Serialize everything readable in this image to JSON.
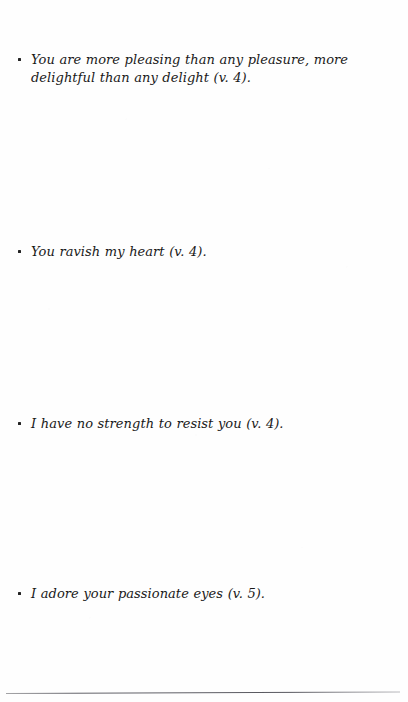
{
  "page": {
    "background_color": "#fefefe",
    "text_color": "#191919",
    "rule_color": "#4a4a50"
  },
  "content": {
    "bullet_marker": "•",
    "items": [
      {
        "text": "You are more pleasing than any pleasure, more delightful than any delight (v. 4)."
      },
      {
        "text": "You ravish my heart (v. 4)."
      },
      {
        "text": "I have no strength to resist you (v. 4)."
      },
      {
        "text": "I adore your passionate eyes (v. 5)."
      }
    ]
  },
  "footer": {
    "rule_present": true
  }
}
